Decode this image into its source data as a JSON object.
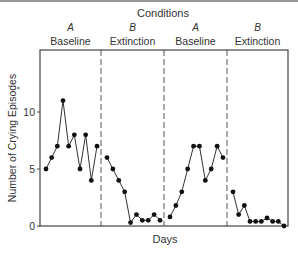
{
  "chart_data": {
    "type": "line",
    "title": "Conditions",
    "xlabel": "Days",
    "ylabel": "Number of Crying Episodes",
    "ylabel_mark": "*",
    "ylim": [
      0,
      13.5
    ],
    "yticks": [
      0,
      5,
      10
    ],
    "grid": false,
    "legend": null,
    "phases": [
      {
        "letter": "A",
        "name": "Baseline",
        "values": [
          5,
          6,
          7,
          11,
          7,
          8,
          5,
          8,
          4,
          7
        ]
      },
      {
        "letter": "B",
        "name": "Extinction",
        "values": [
          6,
          5,
          4,
          3,
          0.3,
          1,
          0.5,
          0.5,
          1,
          0.5
        ]
      },
      {
        "letter": "A",
        "name": "Baseline",
        "values": [
          0.8,
          1.8,
          3,
          5,
          7,
          7,
          4,
          5,
          7,
          6
        ]
      },
      {
        "letter": "B",
        "name": "Extinction",
        "values": [
          3,
          1,
          1.8,
          0.4,
          0.4,
          0.4,
          0.7,
          0.4,
          0.4,
          0
        ]
      }
    ],
    "phase_dividers": "dashed vertical lines"
  }
}
